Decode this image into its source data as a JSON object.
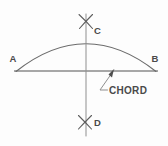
{
  "figure": {
    "background_color": "#fdfdfd",
    "line_color": "#6b6b6b",
    "label_color": "#4a4a4a",
    "labels": {
      "point_a": "A",
      "point_b": "B",
      "point_c": "C",
      "point_d": "D",
      "chord": "CHORD"
    },
    "geometry": {
      "chord_line": {
        "x1": 14,
        "y1": 71,
        "x2": 158,
        "y2": 71
      },
      "arc": {
        "start_x": 16,
        "start_y": 71,
        "end_x": 156,
        "end_y": 71,
        "apex_x": 86,
        "apex_y": 41
      },
      "vertical_bisector": {
        "x": 86,
        "y_top": 14,
        "y_bottom": 136
      },
      "intersection_mark_top": {
        "x": 86,
        "y": 21
      },
      "intersection_mark_bottom": {
        "x": 85,
        "y": 122
      },
      "leader": {
        "tip_x": 114,
        "tip_y": 69,
        "elbow_x": 100,
        "elbow_y": 90,
        "text_x": 107,
        "text_y": 92
      }
    }
  }
}
